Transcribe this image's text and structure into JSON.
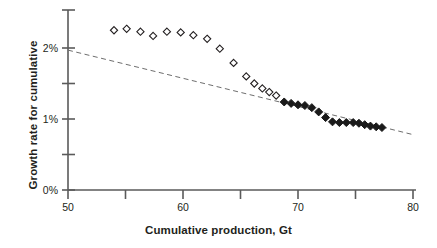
{
  "chart_data": {
    "type": "scatter",
    "title": "",
    "xlabel": "Cumulative production, Gt",
    "ylabel": "Growth rate for cumulative",
    "xlim": [
      50,
      80
    ],
    "ylim": [
      0,
      2.45
    ],
    "grid": false,
    "legend": "none",
    "y_tick_format": "percent",
    "x_ticks_major": [
      50,
      60,
      70,
      80
    ],
    "x_ticks_minor": [
      55,
      65,
      75
    ],
    "x_tick_labels": [
      "50",
      "60",
      "70",
      "80"
    ],
    "y_ticks_major": [
      0,
      1,
      2
    ],
    "y_ticks_minor": [
      0.5,
      1.5
    ],
    "y_tick_labels": [
      "0%",
      "1%",
      "2%"
    ],
    "series": [
      {
        "name": "open-diamonds",
        "marker": "open-diamond",
        "color": "#231f20",
        "fill": "none",
        "x": [
          54.0,
          55.1,
          56.3,
          57.4,
          58.6,
          59.8,
          60.9,
          62.1,
          63.2,
          64.4,
          65.5,
          66.2,
          66.9,
          67.5,
          68.1
        ],
        "y": [
          2.25,
          2.27,
          2.23,
          2.17,
          2.23,
          2.22,
          2.18,
          2.13,
          1.99,
          1.79,
          1.6,
          1.5,
          1.43,
          1.38,
          1.33
        ]
      },
      {
        "name": "filled-diamonds",
        "marker": "filled-diamond",
        "color": "#1a1a1a",
        "fill": "solid",
        "x": [
          68.8,
          69.4,
          70.0,
          70.6,
          71.2,
          71.8,
          72.4,
          73.0,
          73.6,
          74.2,
          74.8,
          75.3,
          75.8,
          76.3,
          76.8,
          77.3
        ],
        "y": [
          1.24,
          1.22,
          1.2,
          1.19,
          1.16,
          1.1,
          1.02,
          0.96,
          0.95,
          0.95,
          0.95,
          0.94,
          0.92,
          0.9,
          0.89,
          0.88
        ]
      }
    ],
    "trendline": {
      "name": "dashed-trend-line",
      "style": "dashed",
      "color": "#6e6e6e",
      "x": [
        50,
        80
      ],
      "y": [
        1.97,
        0.78
      ]
    }
  }
}
